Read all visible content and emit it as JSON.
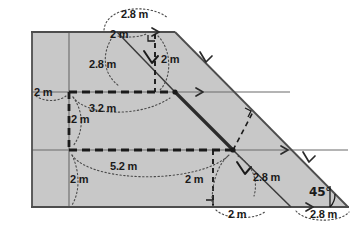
{
  "figure": {
    "fill_color": "#c8c8c8",
    "outline_color": "#4d4d4d",
    "accent_color": "#1a1a1a",
    "background": "#ffffff"
  },
  "shape": {
    "name": "trapezoid",
    "vertices": [
      {
        "name": "top-left",
        "x": 32,
        "y": 32
      },
      {
        "name": "top-right",
        "x": 175,
        "y": 32
      },
      {
        "name": "bottom-right",
        "x": 348,
        "y": 207
      },
      {
        "name": "bottom-left",
        "x": 32,
        "y": 207
      }
    ]
  },
  "grid": {
    "vertical_x": 69,
    "horizontal_y": [
      92,
      150
    ]
  },
  "nodes": {
    "upper_center": {
      "x": 175,
      "y": 92
    },
    "lower_center": {
      "x": 233,
      "y": 150
    },
    "top_diagonal_start": {
      "x": 117,
      "y": 32
    },
    "bottom_diagonal_end": {
      "x": 291,
      "y": 207
    }
  },
  "labels": {
    "top_arc": "2.8 m",
    "top_horizontal": "2 m",
    "upper_diagonal": "2.8 m",
    "upper_vertical": "2 m",
    "left_horizontal": "2 m",
    "mid_horizontal": "3.2 m",
    "left_vertical": "2 m",
    "lower_horizontal": "5.2 m",
    "lower_left_vertical": "2 m",
    "lower_center_vertical": "2 m",
    "lower_diagonal": "2.8 m",
    "bottom_horizontal": "2 m",
    "bottom_right_arc": "2.8 m",
    "angle": "45°"
  }
}
